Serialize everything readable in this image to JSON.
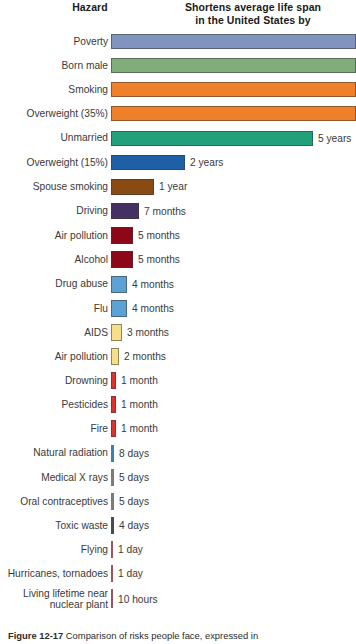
{
  "header": {
    "hazard_label": "Hazard",
    "span_label_line1": "Shortens average life span",
    "span_label_line2": "in the United States by"
  },
  "caption": {
    "figure_number": "Figure 12-17",
    "text": "Comparison of risks people face, expressed in"
  },
  "chart_data": {
    "type": "bar",
    "orientation": "horizontal",
    "title": "Shortens average life span in the United States by",
    "xlabel": "",
    "ylabel": "Hazard",
    "grid": false,
    "legend": false,
    "note": "Top four bars extend beyond the right edge of the image and have no printed value label.",
    "categories": [
      "Poverty",
      "Born male",
      "Smoking",
      "Overweight (35%)",
      "Unmarried",
      "Overweight (15%)",
      "Spouse smoking",
      "Driving",
      "Air pollution",
      "Alcohol",
      "Drug abuse",
      "Flu",
      "AIDS",
      "Air pollution",
      "Drowning",
      "Pesticides",
      "Fire",
      "Natural radiation",
      "Medical X rays",
      "Oral contraceptives",
      "Toxic waste",
      "Flying",
      "Hurricanes, tornadoes",
      "Living lifetime near nuclear plant"
    ],
    "value_labels": [
      "",
      "",
      "",
      "",
      "5 years",
      "2 years",
      "1 year",
      "7 months",
      "5 months",
      "5 months",
      "4 months",
      "4 months",
      "3 months",
      "2 months",
      "1 month",
      "1 month",
      "1 month",
      "8 days",
      "5 days",
      "5 days",
      "4 days",
      "1 day",
      "1 day",
      "10 hours"
    ],
    "values_days": [
      2920,
      2555,
      2190,
      2190,
      1825,
      730,
      365,
      213,
      152,
      152,
      122,
      122,
      91,
      61,
      30,
      30,
      30,
      8,
      5,
      5,
      4,
      1,
      1,
      0.42
    ],
    "bar_colors": [
      "#8094c0",
      "#7fae7a",
      "#ef7f28",
      "#ef7f28",
      "#22a079",
      "#1f5fa8",
      "#8a4a14",
      "#453064",
      "#8c0718",
      "#8c0718",
      "#5ba3d6",
      "#5ba3d6",
      "#f5e089",
      "#f5e089",
      "#e03030",
      "#e03030",
      "#e03030",
      "#3f7fa8",
      "#7b7d73",
      "#7b7d73",
      "#4a4a4e",
      "#9a5560",
      "#9a5560",
      "#9a5560"
    ],
    "bar_pixel_widths": [
      245,
      245,
      245,
      245,
      202,
      74,
      43,
      28,
      22,
      22,
      16,
      16,
      11,
      8,
      5,
      5,
      5,
      3,
      3,
      3,
      3,
      2,
      2,
      2
    ],
    "rows": [
      {
        "label": "Poverty",
        "value": "",
        "color": "#8094c0",
        "w": 245,
        "h": 15,
        "offscreen": true
      },
      {
        "label": "Born male",
        "value": "",
        "color": "#7fae7a",
        "w": 245,
        "h": 15,
        "offscreen": true
      },
      {
        "label": "Smoking",
        "value": "",
        "color": "#ef7f28",
        "w": 245,
        "h": 15,
        "offscreen": true
      },
      {
        "label": "Overweight (35%)",
        "value": "",
        "color": "#ef7f28",
        "w": 245,
        "h": 15,
        "offscreen": true
      },
      {
        "label": "Unmarried",
        "value": "5 years",
        "color": "#22a079",
        "w": 202,
        "h": 15,
        "offscreen": false
      },
      {
        "label": "Overweight (15%)",
        "value": "2 years",
        "color": "#1f5fa8",
        "w": 74,
        "h": 15,
        "offscreen": false
      },
      {
        "label": "Spouse smoking",
        "value": "1 year",
        "color": "#8a4a14",
        "w": 43,
        "h": 16,
        "offscreen": false
      },
      {
        "label": "Driving",
        "value": "7 months",
        "color": "#453064",
        "w": 28,
        "h": 16,
        "offscreen": false
      },
      {
        "label": "Air pollution",
        "value": "5 months",
        "color": "#8c0718",
        "w": 22,
        "h": 17,
        "offscreen": false
      },
      {
        "label": "Alcohol",
        "value": "5 months",
        "color": "#8c0718",
        "w": 22,
        "h": 17,
        "offscreen": false
      },
      {
        "label": "Drug abuse",
        "value": "4 months",
        "color": "#5ba3d6",
        "w": 16,
        "h": 17,
        "offscreen": false
      },
      {
        "label": "Flu",
        "value": "4 months",
        "color": "#5ba3d6",
        "w": 16,
        "h": 17,
        "offscreen": false
      },
      {
        "label": "AIDS",
        "value": "3 months",
        "color": "#f5e089",
        "w": 11,
        "h": 17,
        "offscreen": false
      },
      {
        "label": "Air pollution",
        "value": "2 months",
        "color": "#f5e089",
        "w": 8,
        "h": 17,
        "offscreen": false
      },
      {
        "label": "Drowning",
        "value": "1 month",
        "color": "#e03030",
        "w": 5,
        "h": 17,
        "offscreen": false
      },
      {
        "label": "Pesticides",
        "value": "1 month",
        "color": "#e03030",
        "w": 5,
        "h": 17,
        "offscreen": false
      },
      {
        "label": "Fire",
        "value": "1 month",
        "color": "#e03030",
        "w": 5,
        "h": 17,
        "offscreen": false
      },
      {
        "label": "Natural radiation",
        "value": "8 days",
        "color": "#3f7fa8",
        "w": 3,
        "h": 17,
        "offscreen": false
      },
      {
        "label": "Medical X rays",
        "value": "5 days",
        "color": "#7b7d73",
        "w": 3,
        "h": 17,
        "offscreen": false
      },
      {
        "label": "Oral contraceptives",
        "value": "5 days",
        "color": "#7b7d73",
        "w": 3,
        "h": 17,
        "offscreen": false
      },
      {
        "label": "Toxic waste",
        "value": "4 days",
        "color": "#4a4a4e",
        "w": 3,
        "h": 17,
        "offscreen": false
      },
      {
        "label": "Flying",
        "value": "1 day",
        "color": "#9a5560",
        "w": 2,
        "h": 17,
        "offscreen": false
      },
      {
        "label": "Hurricanes, tornadoes",
        "value": "1 day",
        "color": "#9a5560",
        "w": 2,
        "h": 17,
        "offscreen": false
      },
      {
        "label": "Living lifetime near\nnuclear plant",
        "value": "10 hours",
        "color": "#9a5560",
        "w": 2,
        "h": 19,
        "offscreen": false
      }
    ]
  }
}
